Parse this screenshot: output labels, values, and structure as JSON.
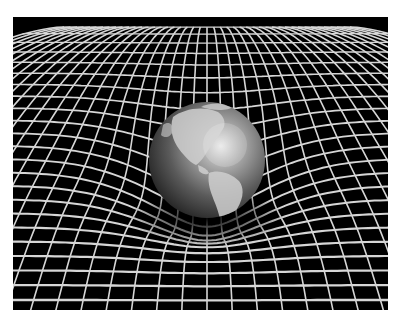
{
  "image": {
    "subject": "Earth resting in a warped spacetime grid",
    "description": "Grayscale globe showing the Americas sitting in a curved white grid on a black background",
    "colors": {
      "background": "#000000",
      "grid": "#d8d8d8",
      "border": "#ffffff"
    }
  }
}
